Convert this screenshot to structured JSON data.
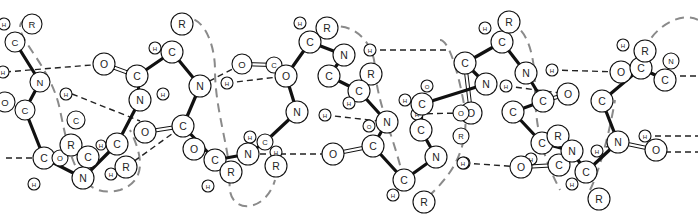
{
  "diagram": {
    "colors": {
      "bond": "#111111",
      "hbond": "#222222",
      "helix_axis": "#8a8a8a",
      "atom_fill": "#ffffff"
    },
    "atoms": [
      {
        "id": "a1",
        "label": "C",
        "x": 15,
        "y": 42,
        "r": 10
      },
      {
        "id": "a2",
        "label": "R",
        "x": 32,
        "y": 24,
        "r": 10
      },
      {
        "id": "a3",
        "label": "H",
        "x": 4,
        "y": 24,
        "r": 6
      },
      {
        "id": "a4",
        "label": "N",
        "x": 40,
        "y": 82,
        "r": 10
      },
      {
        "id": "a5",
        "label": "H",
        "x": 3,
        "y": 72,
        "r": 6
      },
      {
        "id": "a6",
        "label": "H",
        "x": 66,
        "y": 94,
        "r": 6
      },
      {
        "id": "a7",
        "label": "O",
        "x": 5,
        "y": 102,
        "r": 10
      },
      {
        "id": "a8",
        "label": "C",
        "x": 25,
        "y": 110,
        "r": 10
      },
      {
        "id": "a9",
        "label": "O",
        "x": 104,
        "y": 64,
        "r": 11
      },
      {
        "id": "a10",
        "label": "C",
        "x": 137,
        "y": 76,
        "r": 11
      },
      {
        "id": "a11",
        "label": "H",
        "x": 155,
        "y": 48,
        "r": 6
      },
      {
        "id": "a12",
        "label": "C",
        "x": 172,
        "y": 52,
        "r": 11
      },
      {
        "id": "a13",
        "label": "R",
        "x": 182,
        "y": 24,
        "r": 11
      },
      {
        "id": "a14",
        "label": "N",
        "x": 140,
        "y": 100,
        "r": 11
      },
      {
        "id": "a15",
        "label": "H",
        "x": 163,
        "y": 94,
        "r": 6
      },
      {
        "id": "a16",
        "label": "N",
        "x": 200,
        "y": 86,
        "r": 11
      },
      {
        "id": "a17",
        "label": "H",
        "x": 227,
        "y": 83,
        "r": 6
      },
      {
        "id": "a18",
        "label": "O",
        "x": 145,
        "y": 132,
        "r": 11
      },
      {
        "id": "a19",
        "label": "C",
        "x": 183,
        "y": 126,
        "r": 11
      },
      {
        "id": "a20",
        "label": "O",
        "x": 194,
        "y": 149,
        "r": 11
      },
      {
        "id": "a21",
        "label": "C",
        "x": 215,
        "y": 160,
        "r": 11
      },
      {
        "id": "a22",
        "label": "R",
        "x": 231,
        "y": 172,
        "r": 11
      },
      {
        "id": "a23",
        "label": "H",
        "x": 208,
        "y": 186,
        "r": 6
      },
      {
        "id": "a24",
        "label": "C",
        "x": 44,
        "y": 158,
        "r": 11
      },
      {
        "id": "a25",
        "label": "O",
        "x": 60,
        "y": 158,
        "r": 8
      },
      {
        "id": "a26",
        "label": "R",
        "x": 71,
        "y": 145,
        "r": 11
      },
      {
        "id": "a27",
        "label": "C",
        "x": 88,
        "y": 157,
        "r": 11
      },
      {
        "id": "a28",
        "label": "N",
        "x": 83,
        "y": 178,
        "r": 11
      },
      {
        "id": "a29",
        "label": "H",
        "x": 101,
        "y": 145,
        "r": 5
      },
      {
        "id": "a30",
        "label": "C",
        "x": 117,
        "y": 144,
        "r": 11
      },
      {
        "id": "a31",
        "label": "H",
        "x": 111,
        "y": 174,
        "r": 6
      },
      {
        "id": "a32",
        "label": "R",
        "x": 126,
        "y": 167,
        "r": 11
      },
      {
        "id": "a33",
        "label": "H",
        "x": 34,
        "y": 184,
        "r": 6
      },
      {
        "id": "a34",
        "label": "C",
        "x": 76,
        "y": 120,
        "r": 9
      },
      {
        "id": "a35",
        "label": "O",
        "x": 242,
        "y": 64,
        "r": 10
      },
      {
        "id": "a36",
        "label": "C",
        "x": 274,
        "y": 65,
        "r": 8
      },
      {
        "id": "a37",
        "label": "O",
        "x": 286,
        "y": 76,
        "r": 11
      },
      {
        "id": "a38",
        "label": "H",
        "x": 300,
        "y": 23,
        "r": 6
      },
      {
        "id": "a39",
        "label": "C",
        "x": 310,
        "y": 42,
        "r": 11
      },
      {
        "id": "a40",
        "label": "R",
        "x": 327,
        "y": 28,
        "r": 11
      },
      {
        "id": "a41",
        "label": "N",
        "x": 344,
        "y": 55,
        "r": 11
      },
      {
        "id": "a42",
        "label": "H",
        "x": 370,
        "y": 50,
        "r": 6
      },
      {
        "id": "a43",
        "label": "R",
        "x": 371,
        "y": 74,
        "r": 11
      },
      {
        "id": "a44",
        "label": "C",
        "x": 329,
        "y": 76,
        "r": 11
      },
      {
        "id": "a45",
        "label": "C",
        "x": 359,
        "y": 91,
        "r": 11
      },
      {
        "id": "a46",
        "label": "H",
        "x": 349,
        "y": 103,
        "r": 6
      },
      {
        "id": "a47",
        "label": "N",
        "x": 297,
        "y": 112,
        "r": 11
      },
      {
        "id": "a48",
        "label": "H",
        "x": 325,
        "y": 115,
        "r": 6
      },
      {
        "id": "a49",
        "label": "H",
        "x": 250,
        "y": 137,
        "r": 6
      },
      {
        "id": "a50",
        "label": "C",
        "x": 265,
        "y": 142,
        "r": 8
      },
      {
        "id": "a51",
        "label": "N",
        "x": 248,
        "y": 154,
        "r": 11
      },
      {
        "id": "a52",
        "label": "H",
        "x": 276,
        "y": 152,
        "r": 6
      },
      {
        "id": "a53",
        "label": "R",
        "x": 276,
        "y": 166,
        "r": 11
      },
      {
        "id": "a54",
        "label": "O",
        "x": 333,
        "y": 154,
        "r": 11
      },
      {
        "id": "a55",
        "label": "C",
        "x": 373,
        "y": 146,
        "r": 11
      },
      {
        "id": "a56",
        "label": "O",
        "x": 369,
        "y": 126,
        "r": 6
      },
      {
        "id": "a57",
        "label": "N",
        "x": 387,
        "y": 122,
        "r": 11
      },
      {
        "id": "a58",
        "label": "H",
        "x": 417,
        "y": 114,
        "r": 6
      },
      {
        "id": "a59",
        "label": "C",
        "x": 421,
        "y": 130,
        "r": 11
      },
      {
        "id": "a60",
        "label": "N",
        "x": 436,
        "y": 157,
        "r": 11
      },
      {
        "id": "a61",
        "label": "H",
        "x": 464,
        "y": 163,
        "r": 6
      },
      {
        "id": "a62",
        "label": "C",
        "x": 404,
        "y": 180,
        "r": 11
      },
      {
        "id": "a63",
        "label": "H",
        "x": 393,
        "y": 195,
        "r": 6
      },
      {
        "id": "a64",
        "label": "R",
        "x": 424,
        "y": 202,
        "r": 11
      },
      {
        "id": "a65",
        "label": "H",
        "x": 405,
        "y": 100,
        "r": 6
      },
      {
        "id": "a66",
        "label": "C",
        "x": 422,
        "y": 104,
        "r": 11
      },
      {
        "id": "a67",
        "label": "R",
        "x": 461,
        "y": 136,
        "r": 8
      },
      {
        "id": "a68",
        "label": "O",
        "x": 427,
        "y": 86,
        "r": 6
      },
      {
        "id": "a69",
        "label": "N",
        "x": 486,
        "y": 84,
        "r": 11
      },
      {
        "id": "a70",
        "label": "O",
        "x": 471,
        "y": 113,
        "r": 11
      },
      {
        "id": "a71",
        "label": "C",
        "x": 465,
        "y": 63,
        "r": 11
      },
      {
        "id": "a72",
        "label": "O",
        "x": 461,
        "y": 113,
        "r": 8
      },
      {
        "id": "a73",
        "label": "H",
        "x": 485,
        "y": 28,
        "r": 6
      },
      {
        "id": "a74",
        "label": "C",
        "x": 502,
        "y": 42,
        "r": 11
      },
      {
        "id": "a75",
        "label": "R",
        "x": 509,
        "y": 22,
        "r": 11
      },
      {
        "id": "a76",
        "label": "N",
        "x": 526,
        "y": 73,
        "r": 11
      },
      {
        "id": "a77",
        "label": "H",
        "x": 552,
        "y": 70,
        "r": 6
      },
      {
        "id": "a78",
        "label": "H",
        "x": 506,
        "y": 86,
        "r": 6
      },
      {
        "id": "a79",
        "label": "O",
        "x": 568,
        "y": 94,
        "r": 11
      },
      {
        "id": "a80",
        "label": "C",
        "x": 513,
        "y": 112,
        "r": 11
      },
      {
        "id": "a81",
        "label": "C",
        "x": 543,
        "y": 101,
        "r": 11
      },
      {
        "id": "a82",
        "label": "O",
        "x": 621,
        "y": 72,
        "r": 11
      },
      {
        "id": "a83",
        "label": "H",
        "x": 623,
        "y": 45,
        "r": 6
      },
      {
        "id": "a84",
        "label": "C",
        "x": 641,
        "y": 68,
        "r": 11
      },
      {
        "id": "a85",
        "label": "R",
        "x": 645,
        "y": 51,
        "r": 11
      },
      {
        "id": "a86",
        "label": "C",
        "x": 665,
        "y": 80,
        "r": 11
      },
      {
        "id": "a87",
        "label": "N",
        "x": 671,
        "y": 61,
        "r": 8
      },
      {
        "id": "a88",
        "label": "C",
        "x": 602,
        "y": 101,
        "r": 11
      },
      {
        "id": "a89",
        "label": "C",
        "x": 542,
        "y": 143,
        "r": 11
      },
      {
        "id": "a90",
        "label": "R",
        "x": 558,
        "y": 136,
        "r": 11
      },
      {
        "id": "a91",
        "label": "H",
        "x": 531,
        "y": 159,
        "r": 6
      },
      {
        "id": "a92",
        "label": "C",
        "x": 559,
        "y": 165,
        "r": 11
      },
      {
        "id": "a93",
        "label": "O",
        "x": 521,
        "y": 167,
        "r": 11
      },
      {
        "id": "a94",
        "label": "N",
        "x": 572,
        "y": 151,
        "r": 11
      },
      {
        "id": "a95",
        "label": "H",
        "x": 597,
        "y": 151,
        "r": 6
      },
      {
        "id": "a96",
        "label": "C",
        "x": 586,
        "y": 172,
        "r": 11
      },
      {
        "id": "a97",
        "label": "H",
        "x": 572,
        "y": 184,
        "r": 6
      },
      {
        "id": "a98",
        "label": "R",
        "x": 599,
        "y": 199,
        "r": 11
      },
      {
        "id": "a99",
        "label": "H",
        "x": 463,
        "y": 163,
        "r": 6
      },
      {
        "id": "a100",
        "label": "N",
        "x": 618,
        "y": 142,
        "r": 11
      },
      {
        "id": "a101",
        "label": "H",
        "x": 645,
        "y": 136,
        "r": 6
      },
      {
        "id": "a102",
        "label": "O",
        "x": 656,
        "y": 150,
        "r": 11
      }
    ],
    "bonds": [
      [
        "a1",
        "a4"
      ],
      [
        "a4",
        "a8"
      ],
      [
        "a8",
        "a24"
      ],
      [
        "a24",
        "a28"
      ],
      [
        "a28",
        "a30"
      ],
      [
        "a30",
        "a14"
      ],
      [
        "a14",
        "a10"
      ],
      [
        "a10",
        "a12"
      ],
      [
        "a12",
        "a16"
      ],
      [
        "a16",
        "a19"
      ],
      [
        "a19",
        "a21"
      ],
      [
        "a21",
        "a51"
      ],
      [
        "a51",
        "a50"
      ],
      [
        "a50",
        "a47"
      ],
      [
        "a47",
        "a37"
      ],
      [
        "a37",
        "a39"
      ],
      [
        "a39",
        "a41"
      ],
      [
        "a41",
        "a44"
      ],
      [
        "a44",
        "a45"
      ],
      [
        "a45",
        "a57"
      ],
      [
        "a57",
        "a55"
      ],
      [
        "a55",
        "a62"
      ],
      [
        "a62",
        "a60"
      ],
      [
        "a60",
        "a59"
      ],
      [
        "a59",
        "a66"
      ],
      [
        "a66",
        "a69"
      ],
      [
        "a69",
        "a71"
      ],
      [
        "a71",
        "a74"
      ],
      [
        "a74",
        "a76"
      ],
      [
        "a76",
        "a81"
      ],
      [
        "a81",
        "a80"
      ],
      [
        "a80",
        "a89"
      ],
      [
        "a89",
        "a94"
      ],
      [
        "a94",
        "a96"
      ],
      [
        "a96",
        "a100"
      ],
      [
        "a100",
        "a88"
      ],
      [
        "a88",
        "a84"
      ],
      [
        "a84",
        "a86"
      ]
    ],
    "double_bonds": [
      [
        "a9",
        "a10"
      ],
      [
        "a18",
        "a19"
      ],
      [
        "a35",
        "a36"
      ],
      [
        "a54",
        "a55"
      ],
      [
        "a70",
        "a71"
      ],
      [
        "a79",
        "a81"
      ],
      [
        "a82",
        "a84"
      ],
      [
        "a93",
        "a92"
      ],
      [
        "a102",
        "a100"
      ]
    ],
    "hbonds": [
      [
        5,
        72,
        104,
        64
      ],
      [
        72,
        94,
        140,
        121
      ],
      [
        200,
        86,
        242,
        64
      ],
      [
        6,
        158,
        44,
        158
      ],
      [
        126,
        167,
        183,
        126
      ],
      [
        240,
        154,
        333,
        154
      ],
      [
        227,
        83,
        286,
        76
      ],
      [
        370,
        50,
        450,
        50
      ],
      [
        325,
        115,
        387,
        122
      ],
      [
        417,
        114,
        461,
        113
      ],
      [
        552,
        70,
        621,
        72
      ],
      [
        464,
        163,
        521,
        167
      ],
      [
        506,
        86,
        568,
        94
      ],
      [
        597,
        151,
        618,
        142
      ],
      [
        645,
        136,
        698,
        136
      ],
      [
        645,
        152,
        698,
        152
      ],
      [
        670,
        76,
        698,
        76
      ]
    ],
    "helix_paths": [
      "M 25 20 C 5 30, 50 60, 60 110 C 70 160, 80 200, 120 190 C 150 180, 140 150, 130 130",
      "M 180 20 C 200 10, 215 40, 215 70 C 215 110, 230 150, 230 180 C 225 215, 265 215, 275 180",
      "M 326 28 C 350 20, 375 40, 375 70 C 378 110, 400 150, 405 190",
      "M 509 22 C 530 30, 535 60, 535 90 C 535 140, 550 170, 560 190",
      "M 440 40 C 450 40, 460 80, 465 110 C 470 160, 440 185, 425 200",
      "M 645 51 C 650 30, 680 10, 698 20",
      "M 590 190 C 600 170, 610 130, 615 100"
    ]
  }
}
